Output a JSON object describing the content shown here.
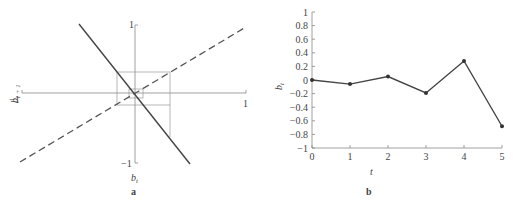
{
  "chart_data": [
    {
      "type": "line",
      "panel_label": "a",
      "title": "",
      "xlabel": "b_t",
      "ylabel": "b_{t+1}",
      "x_ticks": [
        "-1",
        "1"
      ],
      "y_ticks": [
        "1",
        "-1"
      ],
      "xlim": [
        -1,
        1
      ],
      "ylim": [
        -1,
        1
      ],
      "series": [
        {
          "name": "map",
          "style": "solid",
          "points": [
            [
              -0.5,
              1
            ],
            [
              0.5,
              -1
            ]
          ]
        },
        {
          "name": "identity",
          "style": "dashed",
          "points": [
            [
              -1,
              -0.6
            ],
            [
              1,
              0.6
            ]
          ]
        },
        {
          "name": "cobweb",
          "style": "thin",
          "description": "cobweb iteration converging toward origin"
        }
      ]
    },
    {
      "type": "line",
      "panel_label": "b",
      "title": "",
      "xlabel": "t",
      "ylabel": "b_t",
      "categories": [
        0,
        1,
        2,
        3,
        4,
        5
      ],
      "values": [
        0,
        -0.06,
        0.05,
        -0.19,
        0.28,
        -0.68
      ],
      "x_ticks": [
        "0",
        "1",
        "2",
        "3",
        "4",
        "5"
      ],
      "y_ticks": [
        "1",
        "0.8",
        "0.6",
        "0.4",
        "0.2",
        "0",
        "-0.2",
        "-0.4",
        "-0.6",
        "-0.8",
        "-1"
      ],
      "xlim": [
        0,
        5
      ],
      "ylim": [
        -1,
        1
      ],
      "grid": false
    }
  ]
}
